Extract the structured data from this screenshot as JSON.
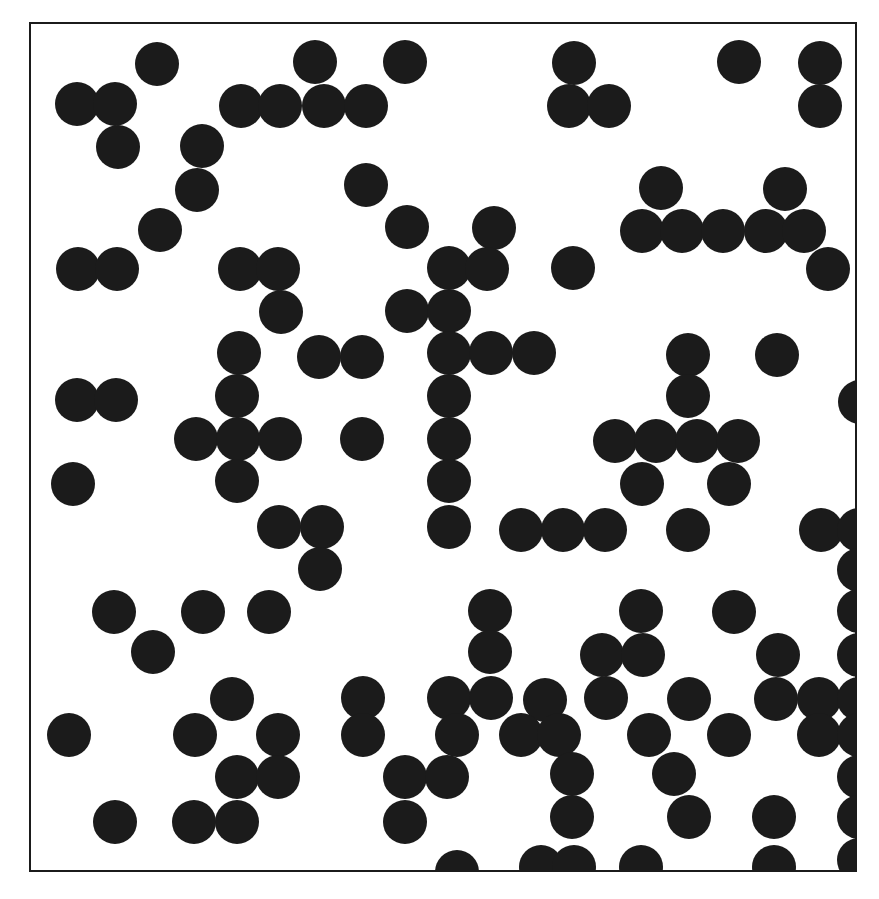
{
  "figure": {
    "background_color": "#ffffff",
    "caption": ""
  },
  "frame": {
    "name": "plot-frame",
    "x": 29,
    "y": 22,
    "width": 828,
    "height": 850,
    "border_width": 2,
    "border_color": "#1b1b1b",
    "fill_color": "#ffffff"
  },
  "chart_data": {
    "type": "scatter",
    "subtitle": "",
    "xlabel": "",
    "ylabel": "",
    "xlim": [
      0,
      828
    ],
    "ylim": [
      0,
      850
    ],
    "grid": false,
    "legend": null,
    "marker": {
      "shape": "circle",
      "color": "#1b1b1b",
      "diameter": 44,
      "edge_color": "#1b1b1b"
    },
    "n_points": 182,
    "units": "pixels",
    "points": [
      [
        128,
        42
      ],
      [
        286,
        40
      ],
      [
        376,
        40
      ],
      [
        545,
        41
      ],
      [
        710,
        40
      ],
      [
        791,
        41
      ],
      [
        48,
        82
      ],
      [
        86,
        82
      ],
      [
        212,
        84
      ],
      [
        251,
        84
      ],
      [
        295,
        84
      ],
      [
        337,
        84
      ],
      [
        540,
        84
      ],
      [
        580,
        84
      ],
      [
        791,
        84
      ],
      [
        89,
        125
      ],
      [
        173,
        124
      ],
      [
        168,
        168
      ],
      [
        337,
        163
      ],
      [
        632,
        166
      ],
      [
        756,
        167
      ],
      [
        131,
        208
      ],
      [
        378,
        205
      ],
      [
        465,
        206
      ],
      [
        613,
        209
      ],
      [
        653,
        209
      ],
      [
        694,
        209
      ],
      [
        737,
        209
      ],
      [
        775,
        209
      ],
      [
        49,
        247
      ],
      [
        88,
        247
      ],
      [
        211,
        247
      ],
      [
        249,
        247
      ],
      [
        420,
        246
      ],
      [
        458,
        247
      ],
      [
        544,
        246
      ],
      [
        799,
        247
      ],
      [
        252,
        290
      ],
      [
        378,
        289
      ],
      [
        420,
        289
      ],
      [
        210,
        331
      ],
      [
        290,
        335
      ],
      [
        333,
        335
      ],
      [
        420,
        331
      ],
      [
        462,
        331
      ],
      [
        505,
        331
      ],
      [
        659,
        333
      ],
      [
        748,
        333
      ],
      [
        208,
        374
      ],
      [
        420,
        374
      ],
      [
        659,
        374
      ],
      [
        48,
        378
      ],
      [
        87,
        378
      ],
      [
        831,
        380
      ],
      [
        167,
        417
      ],
      [
        209,
        417
      ],
      [
        251,
        417
      ],
      [
        333,
        417
      ],
      [
        420,
        417
      ],
      [
        586,
        419
      ],
      [
        627,
        419
      ],
      [
        668,
        419
      ],
      [
        709,
        419
      ],
      [
        208,
        459
      ],
      [
        420,
        459
      ],
      [
        613,
        462
      ],
      [
        700,
        462
      ],
      [
        44,
        462
      ],
      [
        250,
        505
      ],
      [
        293,
        505
      ],
      [
        420,
        505
      ],
      [
        492,
        508
      ],
      [
        534,
        508
      ],
      [
        576,
        508
      ],
      [
        659,
        508
      ],
      [
        792,
        508
      ],
      [
        830,
        508
      ],
      [
        291,
        547
      ],
      [
        830,
        548
      ],
      [
        830,
        589
      ],
      [
        85,
        590
      ],
      [
        174,
        590
      ],
      [
        240,
        590
      ],
      [
        461,
        589
      ],
      [
        612,
        589
      ],
      [
        705,
        590
      ],
      [
        830,
        589
      ],
      [
        124,
        630
      ],
      [
        461,
        630
      ],
      [
        573,
        633
      ],
      [
        614,
        633
      ],
      [
        749,
        633
      ],
      [
        830,
        633
      ],
      [
        203,
        677
      ],
      [
        334,
        676
      ],
      [
        420,
        676
      ],
      [
        462,
        676
      ],
      [
        516,
        678
      ],
      [
        577,
        676
      ],
      [
        660,
        677
      ],
      [
        747,
        677
      ],
      [
        790,
        677
      ],
      [
        830,
        677
      ],
      [
        40,
        713
      ],
      [
        166,
        713
      ],
      [
        249,
        713
      ],
      [
        334,
        713
      ],
      [
        428,
        713
      ],
      [
        492,
        713
      ],
      [
        530,
        713
      ],
      [
        620,
        713
      ],
      [
        700,
        713
      ],
      [
        790,
        713
      ],
      [
        830,
        713
      ],
      [
        208,
        755
      ],
      [
        249,
        755
      ],
      [
        376,
        755
      ],
      [
        418,
        755
      ],
      [
        543,
        752
      ],
      [
        645,
        752
      ],
      [
        830,
        755
      ],
      [
        86,
        800
      ],
      [
        165,
        800
      ],
      [
        208,
        800
      ],
      [
        376,
        800
      ],
      [
        543,
        795
      ],
      [
        660,
        795
      ],
      [
        745,
        795
      ],
      [
        830,
        795
      ],
      [
        428,
        850
      ],
      [
        512,
        845
      ],
      [
        545,
        845
      ],
      [
        612,
        845
      ],
      [
        745,
        845
      ],
      [
        830,
        838
      ]
    ]
  },
  "discs": [
    {
      "cx": 128,
      "cy": 42
    },
    {
      "cx": 286,
      "cy": 40
    },
    {
      "cx": 376,
      "cy": 40
    },
    {
      "cx": 545,
      "cy": 41
    },
    {
      "cx": 710,
      "cy": 40
    },
    {
      "cx": 791,
      "cy": 41
    },
    {
      "cx": 48,
      "cy": 82
    },
    {
      "cx": 86,
      "cy": 82
    },
    {
      "cx": 212,
      "cy": 84
    },
    {
      "cx": 251,
      "cy": 84
    },
    {
      "cx": 295,
      "cy": 84
    },
    {
      "cx": 337,
      "cy": 84
    },
    {
      "cx": 540,
      "cy": 84
    },
    {
      "cx": 580,
      "cy": 84
    },
    {
      "cx": 791,
      "cy": 84
    },
    {
      "cx": 89,
      "cy": 125
    },
    {
      "cx": 173,
      "cy": 124
    },
    {
      "cx": 168,
      "cy": 168
    },
    {
      "cx": 337,
      "cy": 163
    },
    {
      "cx": 632,
      "cy": 166
    },
    {
      "cx": 756,
      "cy": 167
    },
    {
      "cx": 131,
      "cy": 208
    },
    {
      "cx": 378,
      "cy": 205
    },
    {
      "cx": 465,
      "cy": 206
    },
    {
      "cx": 613,
      "cy": 209
    },
    {
      "cx": 653,
      "cy": 209
    },
    {
      "cx": 694,
      "cy": 209
    },
    {
      "cx": 737,
      "cy": 209
    },
    {
      "cx": 775,
      "cy": 209
    },
    {
      "cx": 49,
      "cy": 247
    },
    {
      "cx": 88,
      "cy": 247
    },
    {
      "cx": 211,
      "cy": 247
    },
    {
      "cx": 249,
      "cy": 247
    },
    {
      "cx": 420,
      "cy": 246
    },
    {
      "cx": 458,
      "cy": 247
    },
    {
      "cx": 544,
      "cy": 246
    },
    {
      "cx": 799,
      "cy": 247
    },
    {
      "cx": 252,
      "cy": 290
    },
    {
      "cx": 378,
      "cy": 289
    },
    {
      "cx": 420,
      "cy": 289
    },
    {
      "cx": 210,
      "cy": 331
    },
    {
      "cx": 290,
      "cy": 335
    },
    {
      "cx": 333,
      "cy": 335
    },
    {
      "cx": 420,
      "cy": 331
    },
    {
      "cx": 462,
      "cy": 331
    },
    {
      "cx": 505,
      "cy": 331
    },
    {
      "cx": 659,
      "cy": 333
    },
    {
      "cx": 748,
      "cy": 333
    },
    {
      "cx": 208,
      "cy": 374
    },
    {
      "cx": 420,
      "cy": 374
    },
    {
      "cx": 659,
      "cy": 374
    },
    {
      "cx": 48,
      "cy": 378
    },
    {
      "cx": 87,
      "cy": 378
    },
    {
      "cx": 831,
      "cy": 380
    },
    {
      "cx": 167,
      "cy": 417
    },
    {
      "cx": 209,
      "cy": 417
    },
    {
      "cx": 251,
      "cy": 417
    },
    {
      "cx": 333,
      "cy": 417
    },
    {
      "cx": 420,
      "cy": 417
    },
    {
      "cx": 586,
      "cy": 419
    },
    {
      "cx": 627,
      "cy": 419
    },
    {
      "cx": 668,
      "cy": 419
    },
    {
      "cx": 709,
      "cy": 419
    },
    {
      "cx": 208,
      "cy": 459
    },
    {
      "cx": 420,
      "cy": 459
    },
    {
      "cx": 613,
      "cy": 462
    },
    {
      "cx": 700,
      "cy": 462
    },
    {
      "cx": 44,
      "cy": 462
    },
    {
      "cx": 250,
      "cy": 505
    },
    {
      "cx": 293,
      "cy": 505
    },
    {
      "cx": 420,
      "cy": 505
    },
    {
      "cx": 492,
      "cy": 508
    },
    {
      "cx": 534,
      "cy": 508
    },
    {
      "cx": 576,
      "cy": 508
    },
    {
      "cx": 659,
      "cy": 508
    },
    {
      "cx": 792,
      "cy": 508
    },
    {
      "cx": 830,
      "cy": 508
    },
    {
      "cx": 291,
      "cy": 547
    },
    {
      "cx": 830,
      "cy": 548
    },
    {
      "cx": 830,
      "cy": 589
    },
    {
      "cx": 85,
      "cy": 590
    },
    {
      "cx": 174,
      "cy": 590
    },
    {
      "cx": 240,
      "cy": 590
    },
    {
      "cx": 461,
      "cy": 589
    },
    {
      "cx": 612,
      "cy": 589
    },
    {
      "cx": 705,
      "cy": 590
    },
    {
      "cx": 124,
      "cy": 630
    },
    {
      "cx": 461,
      "cy": 630
    },
    {
      "cx": 573,
      "cy": 633
    },
    {
      "cx": 614,
      "cy": 633
    },
    {
      "cx": 749,
      "cy": 633
    },
    {
      "cx": 830,
      "cy": 633
    },
    {
      "cx": 203,
      "cy": 677
    },
    {
      "cx": 334,
      "cy": 676
    },
    {
      "cx": 420,
      "cy": 676
    },
    {
      "cx": 462,
      "cy": 676
    },
    {
      "cx": 516,
      "cy": 678
    },
    {
      "cx": 577,
      "cy": 676
    },
    {
      "cx": 660,
      "cy": 677
    },
    {
      "cx": 747,
      "cy": 677
    },
    {
      "cx": 790,
      "cy": 677
    },
    {
      "cx": 830,
      "cy": 677
    },
    {
      "cx": 40,
      "cy": 713
    },
    {
      "cx": 166,
      "cy": 713
    },
    {
      "cx": 249,
      "cy": 713
    },
    {
      "cx": 334,
      "cy": 713
    },
    {
      "cx": 428,
      "cy": 713
    },
    {
      "cx": 492,
      "cy": 713
    },
    {
      "cx": 530,
      "cy": 713
    },
    {
      "cx": 620,
      "cy": 713
    },
    {
      "cx": 700,
      "cy": 713
    },
    {
      "cx": 790,
      "cy": 713
    },
    {
      "cx": 830,
      "cy": 713
    },
    {
      "cx": 208,
      "cy": 755
    },
    {
      "cx": 249,
      "cy": 755
    },
    {
      "cx": 376,
      "cy": 755
    },
    {
      "cx": 418,
      "cy": 755
    },
    {
      "cx": 543,
      "cy": 752
    },
    {
      "cx": 645,
      "cy": 752
    },
    {
      "cx": 830,
      "cy": 755
    },
    {
      "cx": 86,
      "cy": 800
    },
    {
      "cx": 165,
      "cy": 800
    },
    {
      "cx": 208,
      "cy": 800
    },
    {
      "cx": 376,
      "cy": 800
    },
    {
      "cx": 543,
      "cy": 795
    },
    {
      "cx": 660,
      "cy": 795
    },
    {
      "cx": 745,
      "cy": 795
    },
    {
      "cx": 830,
      "cy": 795
    },
    {
      "cx": 428,
      "cy": 850
    },
    {
      "cx": 512,
      "cy": 845
    },
    {
      "cx": 545,
      "cy": 845
    },
    {
      "cx": 612,
      "cy": 845
    },
    {
      "cx": 745,
      "cy": 845
    },
    {
      "cx": 830,
      "cy": 838
    }
  ]
}
